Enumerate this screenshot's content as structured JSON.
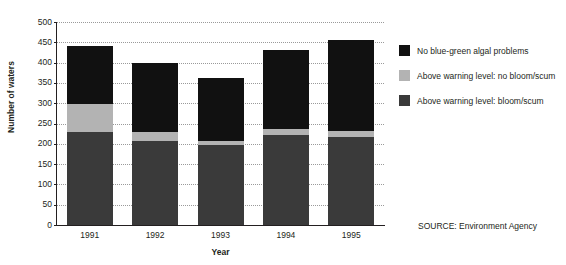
{
  "chart_data": {
    "type": "bar",
    "subtype": "stacked-bar",
    "title": "",
    "xlabel": "Year",
    "ylabel": "Number of waters",
    "categories": [
      "1991",
      "1992",
      "1993",
      "1994",
      "1995"
    ],
    "ylim": [
      0,
      500
    ],
    "ytick_step": 50,
    "yticks": [
      0,
      50,
      100,
      150,
      200,
      250,
      300,
      350,
      400,
      450,
      500
    ],
    "grid": true,
    "legend_position": "right",
    "series": [
      {
        "name": "Above warning level: bloom/scum",
        "color": "#3a3a3a",
        "values": [
          228,
          208,
          196,
          222,
          218
        ]
      },
      {
        "name": "Above warning level: no bloom/scum",
        "color": "#b3b3b3",
        "values": [
          70,
          20,
          10,
          14,
          14
        ]
      },
      {
        "name": "No blue-green algal problems",
        "color": "#111111",
        "values": [
          142,
          172,
          157,
          194,
          224
        ]
      }
    ],
    "totals": [
      440,
      400,
      363,
      430,
      456
    ],
    "source": "SOURCE: Environment Agency"
  },
  "legend": {
    "items": [
      {
        "label": "No blue-green algal problems",
        "color": "#111111"
      },
      {
        "label": "Above warning level: no bloom/scum",
        "color": "#b3b3b3"
      },
      {
        "label": "Above warning level: bloom/scum",
        "color": "#3a3a3a"
      }
    ]
  },
  "colors": {
    "axis": "#231f20",
    "gridline": "#9a9a9a",
    "background": "#ffffff",
    "dark": "#111111",
    "light_grey": "#b3b3b3",
    "mid_grey": "#3a3a3a"
  }
}
